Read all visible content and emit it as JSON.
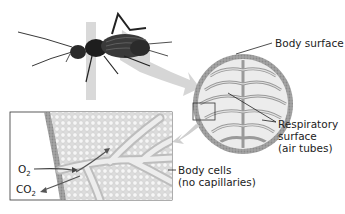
{
  "figure": {
    "labels": {
      "body_surface": "Body surface",
      "respiratory_line1": "Respiratory",
      "respiratory_line2": "surface",
      "respiratory_line3": "(air tubes)",
      "body_cells_line1": "Body cells",
      "body_cells_line2": "(no capillaries)",
      "o2": "O",
      "o2_sub": "2",
      "co2": "CO",
      "co2_sub": "2"
    },
    "colors": {
      "arrow_gray": "#d4d4d4",
      "body_wall": "#a8a8a8",
      "tube_fill": "#e6e6e6",
      "cell_fill": "#efefef",
      "line": "#333333"
    }
  }
}
